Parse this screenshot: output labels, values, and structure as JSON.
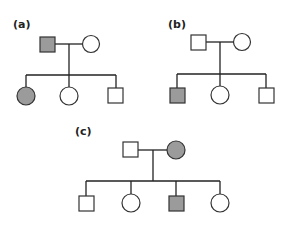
{
  "colors": {
    "affected": "#9b9b9b",
    "unaffected": "#ffffff",
    "stroke": "#333333",
    "line": "#222222"
  },
  "legend_note": "Square = male, circle = female, shaded = affected",
  "pedigrees": [
    {
      "id": "a",
      "label": "(a)",
      "parents": [
        {
          "sex": "male",
          "affected": true
        },
        {
          "sex": "female",
          "affected": false
        }
      ],
      "children": [
        {
          "sex": "female",
          "affected": true
        },
        {
          "sex": "female",
          "affected": false
        },
        {
          "sex": "male",
          "affected": false
        }
      ]
    },
    {
      "id": "b",
      "label": "(b)",
      "parents": [
        {
          "sex": "male",
          "affected": false
        },
        {
          "sex": "female",
          "affected": false
        }
      ],
      "children": [
        {
          "sex": "male",
          "affected": true
        },
        {
          "sex": "female",
          "affected": false
        },
        {
          "sex": "male",
          "affected": false
        }
      ]
    },
    {
      "id": "c",
      "label": "(c)",
      "parents": [
        {
          "sex": "male",
          "affected": false
        },
        {
          "sex": "female",
          "affected": true
        }
      ],
      "children": [
        {
          "sex": "male",
          "affected": false
        },
        {
          "sex": "female",
          "affected": false
        },
        {
          "sex": "male",
          "affected": true
        },
        {
          "sex": "female",
          "affected": false
        }
      ]
    }
  ]
}
